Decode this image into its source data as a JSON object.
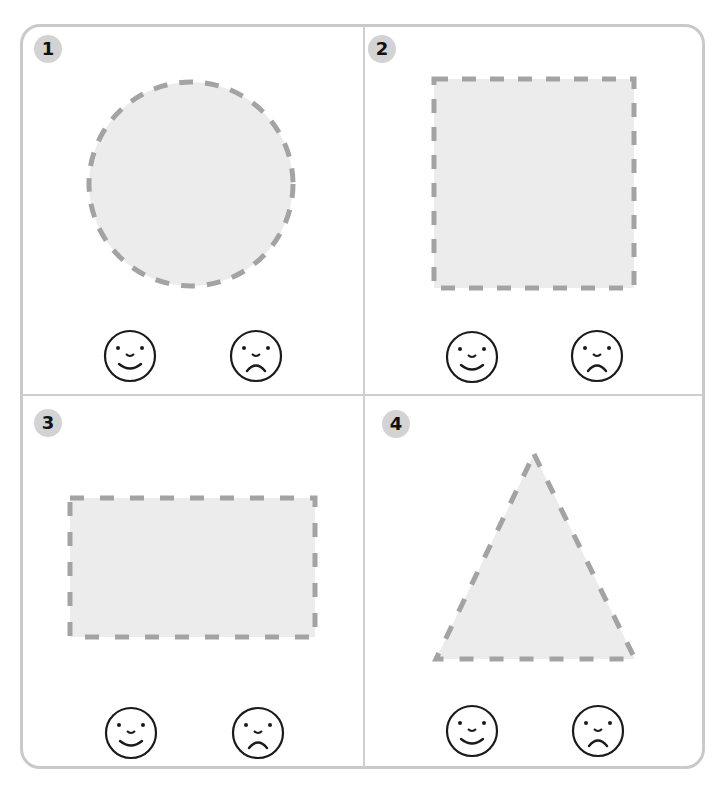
{
  "colors": {
    "shape_fill": "#ececec",
    "shape_dash": "#a3a3a3",
    "badge_bg": "#d3d3d3",
    "border": "#c9c9c9",
    "face_stroke": "#1a1a1a"
  },
  "panels": [
    {
      "number": "1",
      "shape": "circle",
      "faces": [
        "happy",
        "sad"
      ]
    },
    {
      "number": "2",
      "shape": "square",
      "faces": [
        "happy",
        "sad"
      ]
    },
    {
      "number": "3",
      "shape": "rectangle",
      "faces": [
        "happy",
        "sad"
      ]
    },
    {
      "number": "4",
      "shape": "triangle",
      "faces": [
        "happy",
        "sad"
      ]
    }
  ]
}
